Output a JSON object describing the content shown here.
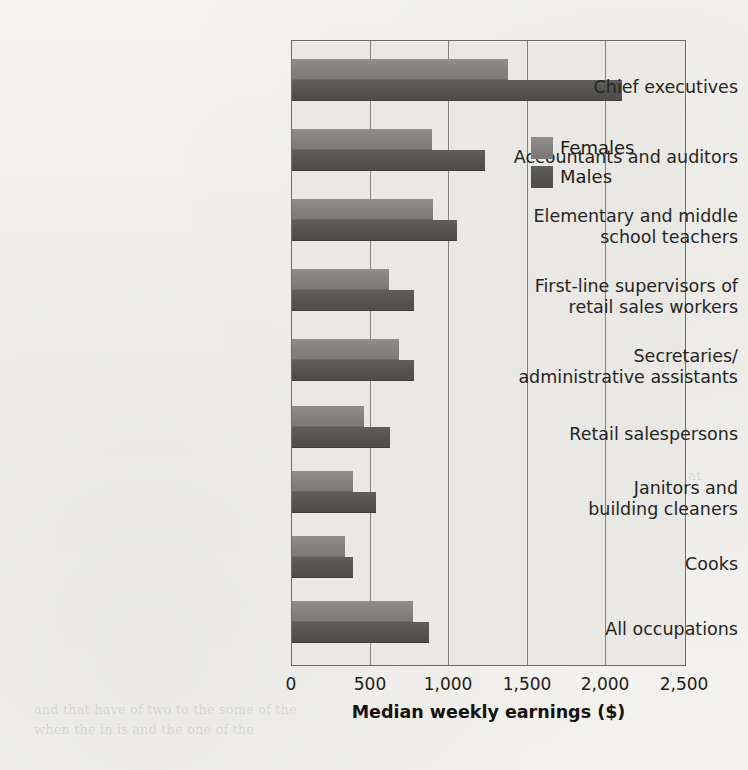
{
  "chart_data": {
    "type": "bar",
    "orientation": "horizontal",
    "title": "",
    "xlabel": "Median weekly earnings ($)",
    "ylabel": "",
    "xlim": [
      0,
      2500
    ],
    "xticks": [
      0,
      500,
      1000,
      1500,
      2000,
      2500
    ],
    "xtick_labels": [
      "0",
      "500",
      "1,000",
      "1,500",
      "2,000",
      "2,500"
    ],
    "grid": "vertical",
    "legend_position": "inside-right-upper",
    "categories": [
      "Chief executives",
      "Accountants and auditors",
      "Elementary and middle\nschool teachers",
      "First-line supervisors of\nretail sales workers",
      "Secretaries/\nadministrative assistants",
      "Retail salespersons",
      "Janitors and\nbuilding cleaners",
      "Cooks",
      "All occupations"
    ],
    "series": [
      {
        "name": "Females",
        "color": "#858380",
        "values": [
          1375,
          890,
          895,
          615,
          680,
          455,
          385,
          335,
          770
        ]
      },
      {
        "name": "Males",
        "color": "#565451",
        "values": [
          2100,
          1225,
          1050,
          775,
          775,
          625,
          535,
          385,
          870
        ]
      }
    ]
  },
  "legend": {
    "items": [
      {
        "label": "Females",
        "swatch": "female-swatch"
      },
      {
        "label": "Males",
        "swatch": "male-swatch"
      }
    ]
  },
  "axis": {
    "x_label": "Median weekly earnings ($)",
    "tick_labels": [
      "0",
      "500",
      "1,000",
      "1,500",
      "2,000",
      "2,500"
    ]
  },
  "category_labels": [
    "Chief executives",
    "Accountants and auditors",
    "Elementary and middle\nschool teachers",
    "First-line supervisors of\nretail sales workers",
    "Secretaries/\nadministrative assistants",
    "Retail salespersons",
    "Janitors and\nbuilding cleaners",
    "Cooks",
    "All occupations"
  ],
  "background_text": {
    "block_1": "and the carnival of the\nin the carnival of the part of workers. Every one\nof them, and their local\nup made up of and as a statement of the business\nof the carnival of the of the many in the one\nin the wake of. The carnival of the work and are\nof the many in the one of the work in the one of\nthe value of any of the last in the part of the one\nof the light in face the one was. It could be seen\nthe main of Central Office and so on. Let it look at the\nthe work on trying on in a market to be",
    "block_2": "and that have of two to the some of the\nwhen the in is and the one of the"
  }
}
